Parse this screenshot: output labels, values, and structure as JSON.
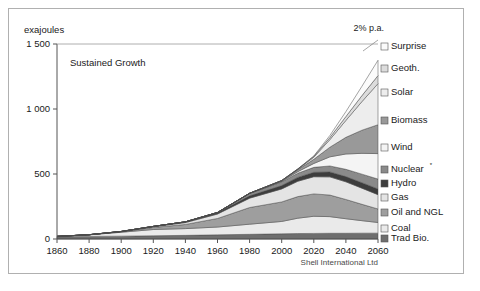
{
  "figure": {
    "unit_label": "exajoules",
    "scenario_label": "Sustained Growth",
    "growth_annotation": "2% p.a.",
    "source": "Shell International Ltd"
  },
  "chart_data": {
    "type": "area",
    "title": "Sustained Growth",
    "subtitle": "",
    "xlabel": "",
    "ylabel": "exajoules",
    "unit": "exajoules",
    "annotations": [
      "2% p.a."
    ],
    "source": "Shell International Ltd",
    "footnote": "* Nuclear",
    "grid": false,
    "legend_position": "right",
    "stacked": true,
    "xlim": [
      1860,
      2060
    ],
    "ylim": [
      0,
      1500
    ],
    "xticks": [
      1860,
      1880,
      1900,
      1920,
      1940,
      1960,
      1980,
      2000,
      2020,
      2040,
      2060
    ],
    "yticks": [
      0,
      500,
      1000,
      1500
    ],
    "x": [
      1860,
      1880,
      1900,
      1920,
      1940,
      1960,
      1980,
      2000,
      2010,
      2020,
      2030,
      2040,
      2050,
      2060
    ],
    "series": [
      {
        "name": "Trad Bio.",
        "color": "#6e6e6e",
        "legend_order": 11,
        "values": [
          18,
          20,
          22,
          25,
          28,
          32,
          36,
          40,
          42,
          43,
          44,
          44,
          45,
          45
        ]
      },
      {
        "name": "Coal",
        "color": "#eaeaea",
        "legend_order": 10,
        "values": [
          2,
          12,
          30,
          48,
          52,
          60,
          78,
          95,
          118,
          132,
          128,
          112,
          96,
          82
        ]
      },
      {
        "name": "Oil and NGL",
        "color": "#9e9e9e",
        "legend_order": 9,
        "values": [
          0,
          1,
          4,
          16,
          32,
          66,
          128,
          150,
          166,
          172,
          166,
          148,
          126,
          104
        ]
      },
      {
        "name": "Gas",
        "color": "#e4e4e4",
        "legend_order": 8,
        "values": [
          0,
          0,
          1,
          5,
          14,
          34,
          72,
          100,
          118,
          132,
          140,
          136,
          124,
          110
        ]
      },
      {
        "name": "Hydro",
        "color": "#3d3d3d",
        "legend_order": 7,
        "values": [
          0,
          0,
          1,
          3,
          6,
          10,
          18,
          26,
          30,
          34,
          38,
          40,
          42,
          44
        ]
      },
      {
        "name": "Nuclear*",
        "color": "#8a8a8a",
        "legend_order": 6,
        "values": [
          0,
          0,
          0,
          0,
          0,
          2,
          18,
          28,
          32,
          38,
          46,
          56,
          66,
          76
        ]
      },
      {
        "name": "Wind",
        "color": "#f4f4f4",
        "legend_order": 5,
        "values": [
          0,
          0,
          0,
          0,
          0,
          0,
          1,
          4,
          12,
          30,
          70,
          118,
          160,
          196
        ]
      },
      {
        "name": "Biomass",
        "color": "#999999",
        "legend_order": 4,
        "values": [
          0,
          0,
          0,
          0,
          0,
          0,
          1,
          5,
          14,
          32,
          74,
          128,
          178,
          222
        ]
      },
      {
        "name": "Solar",
        "color": "#ededed",
        "legend_order": 3,
        "values": [
          0,
          0,
          0,
          0,
          0,
          0,
          0,
          1,
          4,
          16,
          58,
          130,
          220,
          316
        ]
      },
      {
        "name": "Geoth.",
        "color": "#dcdcdc",
        "legend_order": 2,
        "values": [
          0,
          0,
          0,
          0,
          0,
          0,
          0,
          1,
          2,
          6,
          16,
          30,
          46,
          62
        ]
      },
      {
        "name": "Surprise",
        "color": "#fbfbfb",
        "legend_order": 1,
        "values": [
          0,
          0,
          0,
          0,
          0,
          0,
          0,
          0,
          1,
          4,
          16,
          38,
          72,
          118
        ]
      }
    ]
  },
  "legend": {
    "items": [
      {
        "label": "Surprise",
        "color": "#fbfbfb"
      },
      {
        "label": "Geoth.",
        "color": "#dcdcdc"
      },
      {
        "label": "Solar",
        "color": "#ededed"
      },
      {
        "label": "Biomass",
        "color": "#999999"
      },
      {
        "label": "Wind",
        "color": "#f4f4f4"
      },
      {
        "label": "Nuclear",
        "color": "#8a8a8a",
        "superscript": "*"
      },
      {
        "label": "Hydro",
        "color": "#3d3d3d"
      },
      {
        "label": "Gas",
        "color": "#e4e4e4"
      },
      {
        "label": "Oil and NGL",
        "color": "#9e9e9e"
      },
      {
        "label": "Coal",
        "color": "#eaeaea"
      },
      {
        "label": "Trad Bio.",
        "color": "#6e6e6e"
      }
    ]
  },
  "axes": {
    "x_ticks": [
      "1860",
      "1880",
      "1900",
      "1920",
      "1940",
      "1960",
      "1980",
      "2000",
      "2020",
      "2040",
      "2060"
    ],
    "y_ticks": [
      "1500",
      "1000",
      "500",
      "0"
    ]
  }
}
